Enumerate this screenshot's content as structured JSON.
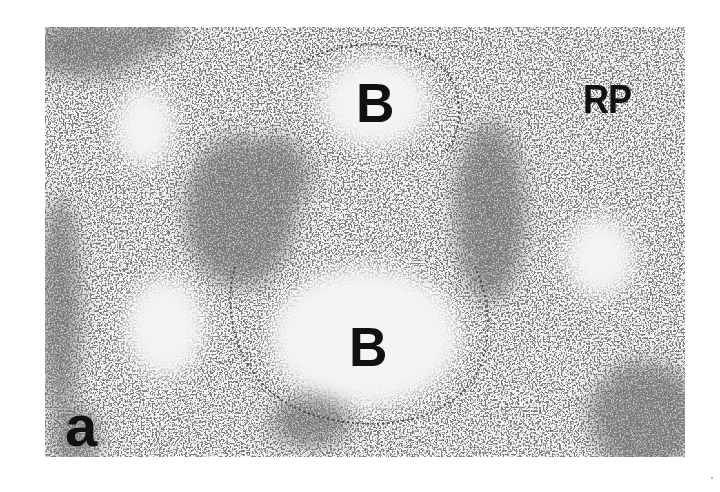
{
  "figure": {
    "panel_label": "a",
    "labels": {
      "b_top": "B",
      "b_bottom": "B",
      "rp": "RP"
    },
    "colors": {
      "background": "#f4f4f4",
      "stain_dark": "#3a3a3a",
      "stain_mid": "#6a6a6a",
      "label": "#111111"
    }
  }
}
